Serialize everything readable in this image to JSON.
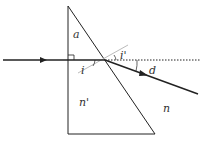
{
  "diagram": {
    "labels": {
      "apex_angle": "a",
      "incidence_angle": "i",
      "refraction_angle": "i'",
      "deviation": "d",
      "prism_index": "n'",
      "medium_index": "n"
    },
    "colors": {
      "line": "#222222",
      "normal": "#bbbbbb",
      "text": "#333333"
    }
  }
}
